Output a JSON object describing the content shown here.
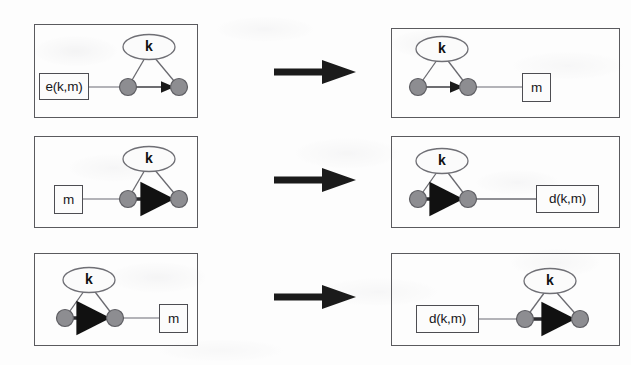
{
  "figure": {
    "kind": "transformation-diagram",
    "background_color": "#fdfdfd",
    "stroke_color": "#5a5a5e",
    "node_fill_color": "#8d8d91",
    "node_stroke_color": "#5e5e63",
    "arrow_color": "#1b1b1b",
    "rows": [
      {
        "id": "row-1",
        "transform_arrow": "thick-right-arrow",
        "left_panel": {
          "id": "row1-left-panel",
          "triangle_side": "right",
          "ellipse_label": "k",
          "box_label": "e(k,m)",
          "box_side": "left",
          "edge_weight": "thin",
          "edge_direction": "left-to-right"
        },
        "right_panel": {
          "id": "row1-right-panel",
          "triangle_side": "left",
          "ellipse_label": "k",
          "box_label": "m",
          "box_side": "right",
          "edge_weight": "thin",
          "edge_direction": "left-to-right"
        }
      },
      {
        "id": "row-2",
        "transform_arrow": "thick-right-arrow",
        "left_panel": {
          "id": "row2-left-panel",
          "triangle_side": "right",
          "ellipse_label": "k",
          "box_label": "m",
          "box_side": "left",
          "edge_weight": "thick",
          "edge_direction": "left-to-right"
        },
        "right_panel": {
          "id": "row2-right-panel",
          "triangle_side": "left",
          "ellipse_label": "k",
          "box_label": "d(k,m)",
          "box_side": "right",
          "edge_weight": "thick",
          "edge_direction": "left-to-right"
        }
      },
      {
        "id": "row-3",
        "transform_arrow": "thick-right-arrow",
        "left_panel": {
          "id": "row3-left-panel",
          "triangle_side": "left",
          "ellipse_label": "k",
          "box_label": "m",
          "box_side": "right",
          "edge_weight": "thick",
          "edge_direction": "left-to-right"
        },
        "right_panel": {
          "id": "row3-right-panel",
          "triangle_side": "right",
          "ellipse_label": "k",
          "box_label": "d(k,m)",
          "box_side": "left",
          "edge_weight": "thick",
          "edge_direction": "left-to-right"
        }
      }
    ]
  }
}
